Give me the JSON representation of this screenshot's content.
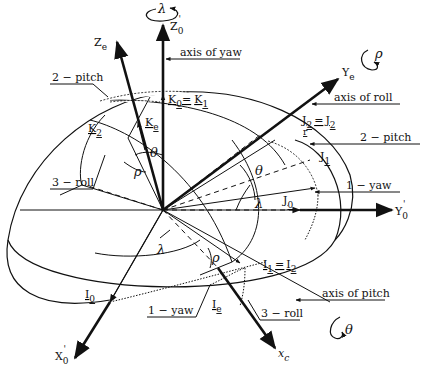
{
  "figure": {
    "type": "euler-angle-rotation-diagram",
    "axes": {
      "z0": {
        "label": "Z",
        "sub": "0",
        "prime": "'"
      },
      "ze": {
        "label": "Z",
        "sub": "e"
      },
      "y0": {
        "label": "Y",
        "sub": "0",
        "prime": "'"
      },
      "ye": {
        "label": "Y",
        "sub": "e"
      },
      "x0": {
        "label": "X",
        "sub": "0",
        "prime": "'"
      },
      "xe": {
        "label": "x",
        "sub": "c"
      }
    },
    "vectors": {
      "k0_eq_k1": {
        "a": "K",
        "as": "0",
        "eq": "=",
        "b": "K",
        "bs": "1"
      },
      "ke": {
        "label": "K",
        "sub": "e"
      },
      "k2": {
        "label": "K",
        "sub": "2"
      },
      "j2_eq_j2r": {
        "a": "J",
        "as": "2",
        "eq": "=",
        "b": "J",
        "bs": "2",
        "extra": "r"
      },
      "j1": {
        "label": "J",
        "sub": "1"
      },
      "j0": {
        "label": "J",
        "sub": "0"
      },
      "i1_eq_i2": {
        "a": "I",
        "as": "1",
        "eq": "=",
        "b": "I",
        "bs": "2"
      },
      "i0": {
        "label": "I",
        "sub": "0"
      },
      "ie": {
        "label": "I",
        "sub": "e"
      }
    },
    "angles": {
      "lambda": "λ",
      "theta": "θ",
      "rho": "ρ"
    },
    "callouts": {
      "axis_of_yaw": "axis of yaw",
      "axis_of_roll": "axis of roll",
      "axis_of_pitch": "axis of pitch",
      "pitch_left": "2 − pitch",
      "pitch_right": "2 − pitch",
      "yaw_right": "1 − yaw",
      "yaw_bottom": "1 − yaw",
      "roll_left": "3 − roll",
      "roll_bottom": "3 − roll"
    },
    "rotation_markers": {
      "yaw": "λ",
      "roll": "ρ",
      "pitch": "θ"
    }
  }
}
